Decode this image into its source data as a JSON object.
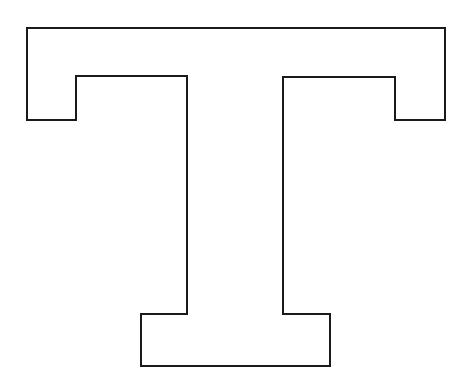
{
  "figure": {
    "letter": "T",
    "stroke_color": "#1a1a1a",
    "fill_color": "#ffffff",
    "background": "#ffffff",
    "stroke_width": 2,
    "outline_points": "27,28 445,28 445,120 395,120 395,77 283,77 283,314 330,314 330,366 141,366 141,314 187,314 187,76 76,76 76,120 27,120"
  }
}
